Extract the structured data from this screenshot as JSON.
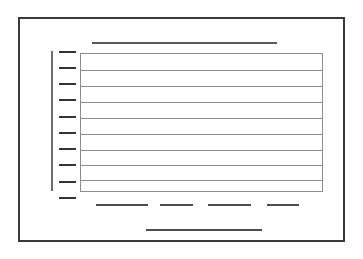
{
  "figure": {
    "title_alt": "chart wireframe placeholder",
    "background_color": "#ffffff",
    "width": 363,
    "height": 259
  },
  "frame": {
    "name": "outer-border",
    "color": "#3a3a3a",
    "thickness": 2,
    "x": 18,
    "y": 17,
    "width": 327,
    "height": 225
  },
  "title_bar": {
    "name": "title-placeholder-line",
    "color": "#5a5a5a",
    "x": 92,
    "y": 42,
    "width": 185,
    "height": 2
  },
  "y_axis": {
    "name": "vertical-axis-line",
    "color": "#6e6e6e",
    "x": 51,
    "y": 51,
    "width": 2,
    "height": 140,
    "tick_color": "#333333",
    "tick_count": 10,
    "tick_width": 17,
    "tick_height": 2,
    "tick_offsets_y": [
      0,
      16,
      32,
      48,
      65,
      81,
      97,
      113,
      130,
      146
    ]
  },
  "grid_box": {
    "name": "plot-grid-box",
    "border_color": "#8d8d8d",
    "fill_color": "#ffffff",
    "x": 80,
    "y": 53,
    "width": 243,
    "height": 139,
    "row_count": 9,
    "divider_count": 8,
    "divider_offsets_y": [
      16,
      32,
      48,
      64,
      80,
      96,
      111,
      126
    ]
  },
  "legend": {
    "name": "legend-placeholder-dashes",
    "color": "#4d4d4d",
    "y": 204,
    "height": 2,
    "items": [
      {
        "label": "legend-dash-1",
        "x": 96,
        "width": 52
      },
      {
        "label": "legend-dash-2",
        "x": 160,
        "width": 33
      },
      {
        "label": "legend-dash-3",
        "x": 208,
        "width": 43
      },
      {
        "label": "legend-dash-4",
        "x": 267,
        "width": 32
      }
    ]
  },
  "x_axis_label": {
    "name": "x-axis-label-placeholder",
    "color": "#4d4d4d",
    "x": 146,
    "y": 229,
    "width": 116,
    "height": 2
  }
}
